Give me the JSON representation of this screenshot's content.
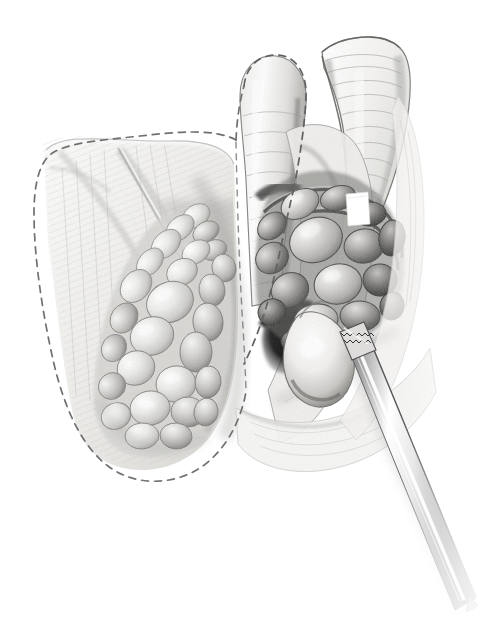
{
  "figure": {
    "domain": "Natural-Image",
    "medium": "graphite pencil medical illustration",
    "caption": "Surgical pencil illustration of the ileocecal region: the terminal ileum and cecum are retracted, an enlarged lobular mesenteric lymph node mass is exposed, a dashed line marks the planned resection margin, and a surgical instrument enters from the lower right.",
    "background_color": "#ffffff",
    "width": 487,
    "height": 622,
    "has_text_labels": false,
    "palette": {
      "paper": "#ffffff",
      "line_dark": "#2b2b2b",
      "mid_gray": "#8d8d8d",
      "light_gray": "#d7d7d7",
      "pale_tissue": "#f2f1ef",
      "shadow_deep": "#141414",
      "dash_line": "#6e6e6e",
      "instrument_steel": "#bdbdbd",
      "highlight_white": "#ffffff"
    },
    "regions": [
      {
        "name": "resection-margin-dashed-line",
        "label": "Planned resection margin",
        "description": "Long dashed outline enclosing the left bowel segment and lobular mass",
        "stroke": "#6e6e6e",
        "style": "dashed"
      },
      {
        "name": "retracted-bowel-wall-left",
        "label": "Retracted bowel wall (left)",
        "description": "Pale striated serosal surface folded open toward the viewer"
      },
      {
        "name": "lobular-node-mass-left",
        "label": "Lobular mesenteric mass (pale)",
        "description": "Cluster of rounded pale lobules occupying the lower center-left",
        "lobule_count": 26
      },
      {
        "name": "lobular-node-mass-right",
        "label": "Lobular mesenteric mass (dark)",
        "description": "Darker shaded cluster of rounded nodes in the right upper quadrant",
        "lobule_count": 17
      },
      {
        "name": "terminal-ileum-stump",
        "label": "Terminal ileum stump",
        "description": "Tubular segment rising at top center, outlined with dashes"
      },
      {
        "name": "cecum-haustral-fan",
        "label": "Cecum with haustral striations",
        "description": "Fan-shaped structure at upper right with horizontal fold lines",
        "striation_count": 16
      },
      {
        "name": "appendix-bulb",
        "label": "Bulbous node / appendiceal stump",
        "description": "Bright rounded bulb at center with deep shadow behind it"
      },
      {
        "name": "deep-shadow-recess",
        "label": "Deep shadow recess",
        "description": "Dark crescent cavity behind the bulbous structure"
      },
      {
        "name": "surgical-clip-highlight",
        "label": "Bright clip highlight",
        "description": "Small white rectangular highlight near the upper right node mass"
      },
      {
        "name": "surgical-instrument",
        "label": "Surgical instrument",
        "description": "Long tapered steel shaft entering from lower right with serrated jaw at tip",
        "tip_serration_count": 14
      }
    ]
  }
}
